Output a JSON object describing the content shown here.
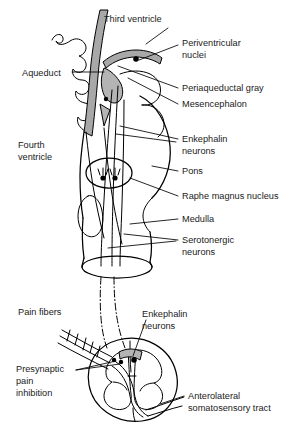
{
  "figure": {
    "ink_color": "#000000",
    "shade_color": "#a8a8a8",
    "background": "#ffffff"
  },
  "labels": {
    "third_ventricle": "Third ventricle",
    "periventricular_nuclei_line1": "Periventricular",
    "periventricular_nuclei_line2": "nuclei",
    "aqueduct": "Aqueduct",
    "periaqueductal_gray": "Periaqueductal gray",
    "mesencephalon": "Mesencephalon",
    "fourth_ventricle_line1": "Fourth",
    "fourth_ventricle_line2": "ventricle",
    "enkephalin_neurons_brain_line1": "Enkephalin",
    "enkephalin_neurons_brain_line2": "neurons",
    "pons": "Pons",
    "raphe_magnus_nucleus": "Raphe magnus nucleus",
    "medulla": "Medulla",
    "serotonergic_neurons_line1": "Serotonergic",
    "serotonergic_neurons_line2": "neurons",
    "pain_fibers": "Pain fibers",
    "enkephalin_neurons_cord_line1": "Enkephalin",
    "enkephalin_neurons_cord_line2": "neurons",
    "presynaptic_pain_inhibition_line1": "Presynaptic",
    "presynaptic_pain_inhibition_line2": "pain",
    "presynaptic_pain_inhibition_line3": "inhibition",
    "anterolateral_tract_line1": "Anterolateral",
    "anterolateral_tract_line2": "somatosensory tract"
  },
  "structures": [
    {
      "name": "third-ventricle",
      "label": "Third ventricle"
    },
    {
      "name": "periventricular-nuclei",
      "label": "Periventricular nuclei"
    },
    {
      "name": "aqueduct",
      "label": "Aqueduct"
    },
    {
      "name": "periaqueductal-gray",
      "label": "Periaqueductal gray"
    },
    {
      "name": "mesencephalon",
      "label": "Mesencephalon"
    },
    {
      "name": "fourth-ventricle",
      "label": "Fourth ventricle"
    },
    {
      "name": "enkephalin-neurons-brainstem",
      "label": "Enkephalin neurons"
    },
    {
      "name": "pons",
      "label": "Pons"
    },
    {
      "name": "raphe-magnus-nucleus",
      "label": "Raphe magnus nucleus"
    },
    {
      "name": "medulla",
      "label": "Medulla"
    },
    {
      "name": "serotonergic-neurons",
      "label": "Serotonergic neurons"
    },
    {
      "name": "pain-fibers",
      "label": "Pain fibers"
    },
    {
      "name": "enkephalin-neurons-spinal",
      "label": "Enkephalin neurons"
    },
    {
      "name": "presynaptic-pain-inhibition",
      "label": "Presynaptic pain inhibition"
    },
    {
      "name": "anterolateral-somatosensory-tract",
      "label": "Anterolateral somatosensory tract"
    }
  ]
}
